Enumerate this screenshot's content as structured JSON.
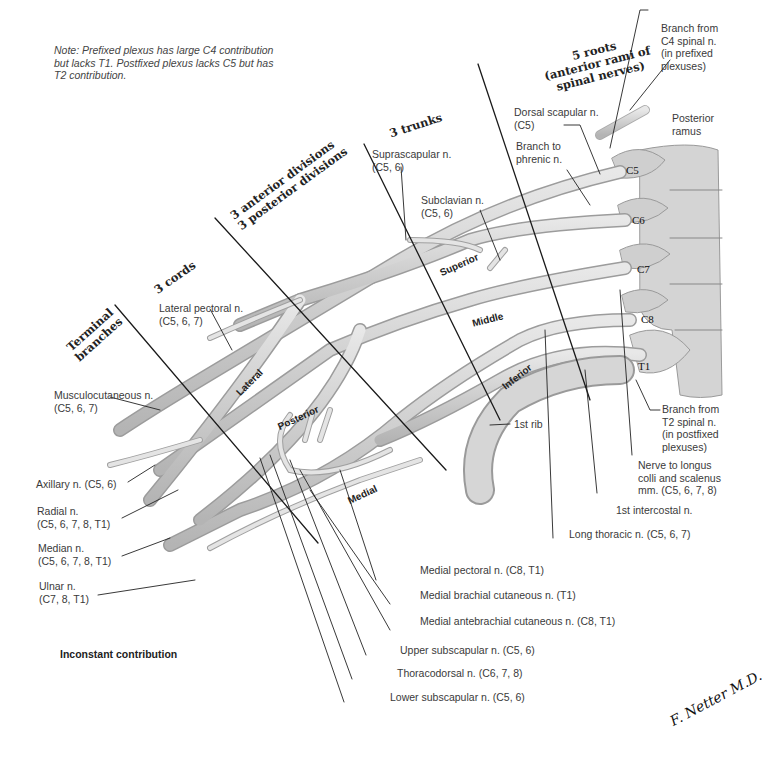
{
  "note": "Note: Prefixed plexus has large C4 contribution but lacks T1. Postfixed plexus lacks C5 but has T2 contribution.",
  "stages": {
    "roots": "5 roots (anterior rami of spinal nerves)",
    "roots_l1": "5 roots",
    "roots_l2": "(anterior rami of",
    "roots_l3": "spinal nerves)",
    "trunks": "3 trunks",
    "divisions_l1": "3 anterior divisions",
    "divisions_l2": "3 posterior divisions",
    "cords": "3 cords",
    "terminal_l1": "Terminal",
    "terminal_l2": "branches"
  },
  "components": {
    "trunks": [
      "Superior",
      "Middle",
      "Inferior"
    ],
    "cords": [
      "Lateral",
      "Posterior",
      "Medial"
    ],
    "roots": [
      "C5",
      "C6",
      "C7",
      "C8",
      "T1"
    ]
  },
  "labels": {
    "branch_c4_l1": "Branch from",
    "branch_c4_l2": "C4 spinal n.",
    "branch_c4_l3": "(in prefixed",
    "branch_c4_l4": "plexuses)",
    "posterior_ramus_l1": "Posterior",
    "posterior_ramus_l2": "ramus",
    "dorsal_scapular_l1": "Dorsal scapular n.",
    "dorsal_scapular_l2": "(C5)",
    "branch_phrenic_l1": "Branch to",
    "branch_phrenic_l2": "phrenic n.",
    "suprascapular_l1": "Suprascapular n.",
    "suprascapular_l2": "(C5, 6)",
    "subclavian_l1": "Subclavian n.",
    "subclavian_l2": "(C5, 6)",
    "lateral_pectoral_l1": "Lateral pectoral n.",
    "lateral_pectoral_l2": "(C5, 6, 7)",
    "musculocutaneous_l1": "Musculocutaneous n.",
    "musculocutaneous_l2": "(C5, 6, 7)",
    "axillary": "Axillary n. (C5, 6)",
    "radial_l1": "Radial n.",
    "radial_l2": "(C5, 6, 7, 8, T1)",
    "median_l1": "Median n.",
    "median_l2": "(C5, 6, 7, 8, T1)",
    "ulnar_l1": "Ulnar n.",
    "ulnar_l2": "(C7, 8, T1)",
    "first_rib": "1st rib",
    "branch_t2_l1": "Branch from",
    "branch_t2_l2": "T2 spinal n.",
    "branch_t2_l3": "(in postfixed",
    "branch_t2_l4": "plexuses)",
    "longus_colli_l1": "Nerve to longus",
    "longus_colli_l2": "colli and scalenus",
    "longus_colli_l3": "mm. (C5, 6, 7, 8)",
    "first_intercostal": "1st intercostal n.",
    "long_thoracic": "Long thoracic n. (C5, 6, 7)",
    "medial_pectoral": "Medial pectoral n. (C8, T1)",
    "medial_brachial_cutaneous": "Medial brachial cutaneous n. (T1)",
    "medial_antebrachial_cutaneous": "Medial antebrachial cutaneous n. (C8, T1)",
    "upper_subscapular": "Upper subscapular n. (C5, 6)",
    "thoracodorsal": "Thoracodorsal n. (C6, 7, 8)",
    "lower_subscapular": "Lower subscapular n. (C5, 6)"
  },
  "legend": {
    "inconstant": "Inconstant contribution"
  },
  "signature": "F. Netter M.D."
}
